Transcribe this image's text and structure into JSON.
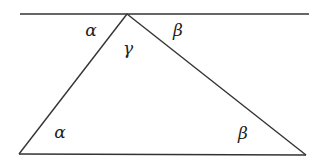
{
  "diagram": {
    "type": "geometry",
    "colors": {
      "stroke": "#333333",
      "text": "#222222",
      "background": "#ffffff"
    },
    "lines": {
      "parallel_line": {
        "x1": 20,
        "y1": 14,
        "x2": 309,
        "y2": 14
      },
      "base": {
        "x1": 19,
        "y1": 154,
        "x2": 306,
        "y2": 155
      },
      "left_side": {
        "x1": 127,
        "y1": 14,
        "x2": 19,
        "y2": 154
      },
      "right_side": {
        "x1": 127,
        "y1": 14,
        "x2": 306,
        "y2": 155
      }
    },
    "labels": [
      {
        "id": "alpha-top",
        "text": "α",
        "x": 91,
        "y": 30
      },
      {
        "id": "gamma-apex",
        "text": "γ",
        "x": 128,
        "y": 48
      },
      {
        "id": "beta-top",
        "text": "β",
        "x": 178,
        "y": 30
      },
      {
        "id": "alpha-bottom",
        "text": "α",
        "x": 60,
        "y": 132
      },
      {
        "id": "beta-bottom",
        "text": "β",
        "x": 243,
        "y": 133
      }
    ]
  }
}
